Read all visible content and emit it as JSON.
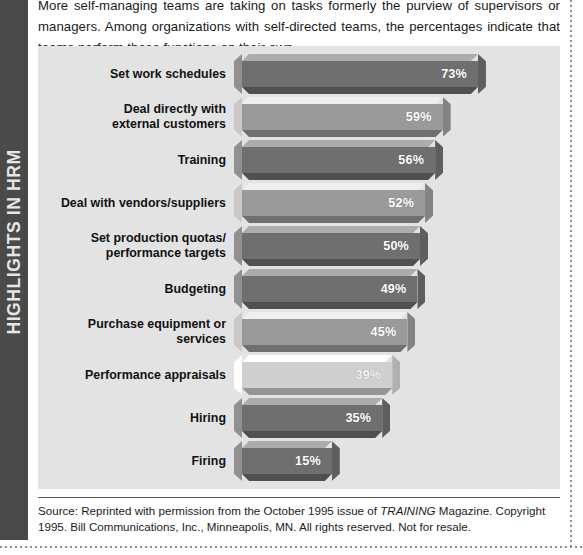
{
  "sidebar": {
    "label": "HIGHLIGHTS IN HRM"
  },
  "intro": {
    "text": "More self-managing teams are taking on tasks formerly the purview of supervisors or managers. Among organizations with self-directed teams, the percentages indicate that teams perform these functions on their own."
  },
  "source": {
    "prefix": "Source: Reprinted with permission from the October 1995 issue of ",
    "italic": "TRAINING",
    "suffix": " Magazine. Copyright 1995. Bill Communications, Inc., Minneapolis, MN. All rights reserved. Not for resale."
  },
  "colors": {
    "panel_background": "#e3e3e3",
    "sidebar": "#4a4a4a",
    "bar_dark": "#6f6f6f",
    "bar_mid": "#9a9a9a",
    "bar_light": "#cfcfcf",
    "value_text": "#ffffff"
  },
  "chart_data": {
    "type": "bar",
    "orientation": "horizontal",
    "title": "",
    "xlabel": "",
    "ylabel": "",
    "xlim": [
      0,
      100
    ],
    "grid": false,
    "legend": null,
    "value_suffix": "%",
    "categories": [
      "Set work schedules",
      "Deal directly with external customers",
      "Training",
      "Deal with vendors/suppliers",
      "Set production quotas/ performance targets",
      "Budgeting",
      "Purchase equipment or services",
      "Performance appraisals",
      "Hiring",
      "Firing"
    ],
    "values": [
      73,
      59,
      56,
      52,
      50,
      49,
      45,
      39,
      35,
      15
    ],
    "value_labels": [
      "73%",
      "59%",
      "56%",
      "52%",
      "50%",
      "49%",
      "45%",
      "39%",
      "35%",
      "15%"
    ],
    "bars": [
      {
        "label_line1": "Set work schedules",
        "label_line2": "",
        "value": 73,
        "value_label": "73%",
        "shade": "dark"
      },
      {
        "label_line1": "Deal directly with",
        "label_line2": "external customers",
        "value": 59,
        "value_label": "59%",
        "shade": "mid"
      },
      {
        "label_line1": "Training",
        "label_line2": "",
        "value": 56,
        "value_label": "56%",
        "shade": "dark"
      },
      {
        "label_line1": "Deal with vendors/suppliers",
        "label_line2": "",
        "value": 52,
        "value_label": "52%",
        "shade": "mid"
      },
      {
        "label_line1": "Set production quotas/",
        "label_line2": "performance targets",
        "value": 50,
        "value_label": "50%",
        "shade": "dark"
      },
      {
        "label_line1": "Budgeting",
        "label_line2": "",
        "value": 49,
        "value_label": "49%",
        "shade": "dark"
      },
      {
        "label_line1": "Purchase equipment or services",
        "label_line2": "",
        "value": 45,
        "value_label": "45%",
        "shade": "mid"
      },
      {
        "label_line1": "Performance appraisals",
        "label_line2": "",
        "value": 39,
        "value_label": "39%",
        "shade": "light"
      },
      {
        "label_line1": "Hiring",
        "label_line2": "",
        "value": 35,
        "value_label": "35%",
        "shade": "dark"
      },
      {
        "label_line1": "Firing",
        "label_line2": "",
        "value": 15,
        "value_label": "15%",
        "shade": "dark"
      }
    ]
  }
}
